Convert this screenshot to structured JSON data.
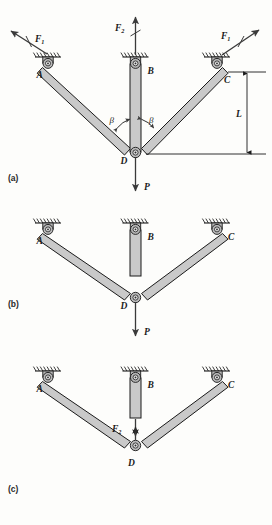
{
  "figure": {
    "type": "mechanism-free-body-diagram",
    "background_color": "#fdfdfb",
    "link_fill": "#c9c9c9",
    "stroke_color": "#1a1a1a"
  },
  "panels": [
    {
      "id": "a",
      "label": "(a)",
      "joint_labels": [
        "A",
        "B",
        "C",
        "D"
      ],
      "forces": [
        {
          "name": "F1",
          "base": "F",
          "sub": "1",
          "at": "A",
          "direction": "up-left",
          "slashed": true
        },
        {
          "name": "F2",
          "base": "F",
          "sub": "2",
          "at": "B",
          "direction": "up",
          "slashed": true
        },
        {
          "name": "F1",
          "base": "F",
          "sub": "1",
          "at": "C",
          "direction": "up-right",
          "slashed": true
        },
        {
          "name": "P",
          "base": "P",
          "sub": "",
          "at": "D",
          "direction": "down",
          "slashed": false
        }
      ],
      "angles": [
        {
          "name": "beta",
          "glyph": "β",
          "between": "link-AD and link-BD"
        },
        {
          "name": "beta",
          "glyph": "β",
          "between": "link-BD and link-CD"
        }
      ],
      "dimensions": [
        {
          "name": "L",
          "glyph": "L",
          "from": "C pin level",
          "to": "D level",
          "orientation": "vertical"
        }
      ]
    },
    {
      "id": "b",
      "label": "(b)",
      "joint_labels": [
        "A",
        "B",
        "C",
        "D"
      ],
      "forces": [
        {
          "name": "P",
          "base": "P",
          "sub": "",
          "at": "D",
          "direction": "down",
          "slashed": false
        }
      ],
      "note": "vertical link BD shown detached as a stub hanging from B"
    },
    {
      "id": "c",
      "label": "(c)",
      "joint_labels": [
        "A",
        "B",
        "C",
        "D"
      ],
      "forces": [
        {
          "name": "F2",
          "base": "F",
          "sub": "2",
          "at": "between stub and D",
          "direction": "action-reaction pair",
          "slashed": false
        }
      ],
      "note": "internal force F2 shown as opposing arrow pair between detached stub BD and joint D"
    }
  ],
  "supports": {
    "type": "pinned-ground-support",
    "count_per_panel": 3,
    "hatching": "diagonal ground hatch above each pin block"
  }
}
